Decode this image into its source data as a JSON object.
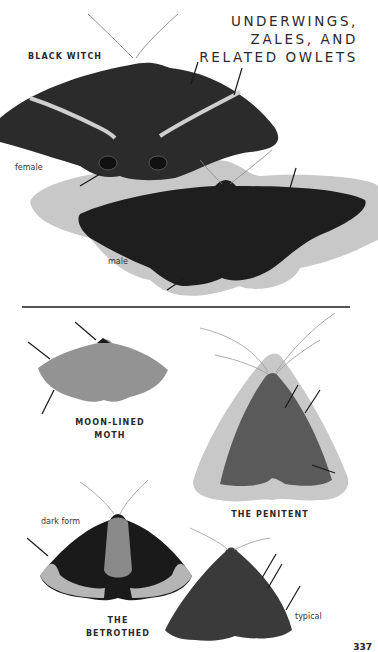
{
  "page": {
    "heading_lines": [
      "UNDERWINGS,",
      "ZALES, AND",
      "RELATED OWLETS"
    ],
    "page_number": "337"
  },
  "species": [
    {
      "name_lines": [
        "BLACK WITCH"
      ],
      "forms": [
        {
          "label": "female",
          "color": "#2b2b2b"
        },
        {
          "label": "male",
          "color": "#1e1e1e"
        }
      ],
      "shadow_color": "#c8c8c8"
    },
    {
      "name_lines": [
        "MOON-LINED",
        "MOTH"
      ],
      "color": "#8f8f8f"
    },
    {
      "name_lines": [
        "THE PENITENT"
      ],
      "color": "#5a5a5a",
      "shadow_color": "#c8c8c8"
    },
    {
      "name_lines": [
        "THE",
        "BETROTHED"
      ],
      "forms": [
        {
          "label": "dark form",
          "color": "#1a1a1a"
        },
        {
          "label": "typical",
          "color": "#3a3a3a"
        }
      ]
    }
  ],
  "colors": {
    "background": "#ffffff",
    "text": "#2a2a2a",
    "divider": "#555555",
    "pointer": "#1a1a1a"
  }
}
